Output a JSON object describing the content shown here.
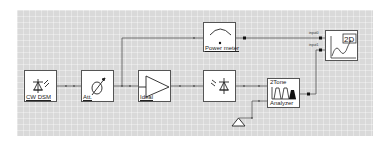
{
  "canvas": {
    "background": "#d9d9d9",
    "wire_color": "#555555"
  },
  "blocks": {
    "cw_dsm": {
      "label": "CW DSM",
      "icon": "laser-source-icon"
    },
    "attenuator": {
      "label": "Att.",
      "icon": "attenuator-icon"
    },
    "amplifier": {
      "label": "Ideal",
      "icon": "amplifier-triangle-icon"
    },
    "photodetector": {
      "label": "",
      "icon": "photodiode-icon"
    },
    "power_meter": {
      "label": "Power meter",
      "icon": "meter-gauge-icon"
    },
    "two_tone": {
      "label_top": "2Tone",
      "label_bottom": "Analyzer",
      "icon": "spectrum-icon"
    },
    "plot_2d": {
      "label": "2D",
      "icon": "2d-plot-icon"
    },
    "ground": {
      "icon": "ground-icon"
    }
  },
  "ports": {
    "input0": "input0",
    "input1": "input1"
  }
}
